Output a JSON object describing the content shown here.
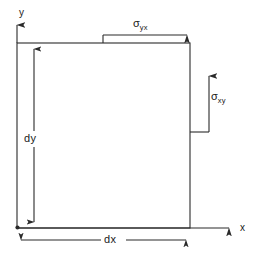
{
  "figure": {
    "type": "stress-element-diagram",
    "line_color": "#2a2a2a",
    "text_color": "#1a1a1a",
    "background_color": "#ffffff"
  },
  "axes": {
    "y_axis": {
      "label": "y",
      "direction": "up",
      "origin_x": 17,
      "origin_y": 43,
      "tip_y": 22
    },
    "x_axis": {
      "label": "x",
      "direction": "right",
      "origin_x": 17,
      "origin_y": 228,
      "tip_x": 232
    }
  },
  "element": {
    "name": "differential-element",
    "shape": "rectangle",
    "left": 17,
    "top": 43,
    "right": 190,
    "bottom": 228
  },
  "stresses": [
    {
      "id": "sigma-yx",
      "symbol": "σ",
      "subscript": "yx",
      "orientation": "horizontal",
      "arrow_direction": "right",
      "applied_on": "top-face",
      "label_x": 133,
      "label_y": 18
    },
    {
      "id": "sigma-xy",
      "symbol": "σ",
      "subscript": "xy",
      "orientation": "vertical",
      "arrow_direction": "up",
      "applied_on": "right-face",
      "label_x": 211,
      "label_y": 91
    }
  ],
  "dimensions": [
    {
      "id": "dy",
      "label": "dy",
      "orientation": "vertical",
      "measures": "element-height",
      "label_x": 24,
      "label_y": 133
    },
    {
      "id": "dx",
      "label": "dx",
      "orientation": "horizontal",
      "measures": "element-width",
      "label_x": 103,
      "label_y": 231
    }
  ]
}
